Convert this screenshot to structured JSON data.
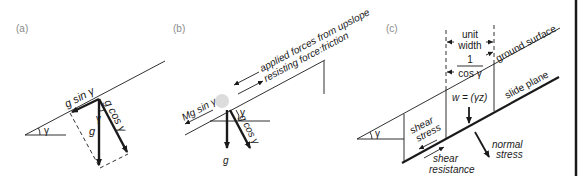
{
  "panels": {
    "a": {
      "label": "(a)",
      "angle_symbol": "γ",
      "forces": {
        "downslope": "g sin γ",
        "normal": "g cos γ",
        "gravity": "g"
      }
    },
    "b": {
      "label": "(b)",
      "angle_symbol": "γ",
      "applied_forces": "applied forces from upslope",
      "resisting_force": "resisting force:friction",
      "downslope": "Mg sin γ",
      "normal": "g cos γ",
      "gravity": "g"
    },
    "c": {
      "label": "(c)",
      "angle_symbol": "γ",
      "unit_width_line1": "unit",
      "unit_width_line2": "width",
      "fraction_numerator": "1",
      "fraction_denominator": "cos γ",
      "ground_surface": "ground surface",
      "slide_plane": "slide plane",
      "weight": "w = (γz)",
      "shear_stress_line1": "shear",
      "shear_stress_line2": "stress",
      "shear_resistance_line1": "shear",
      "shear_resistance_line2": "resistance",
      "normal_stress_line1": "normal",
      "normal_stress_line2": "stress"
    }
  }
}
